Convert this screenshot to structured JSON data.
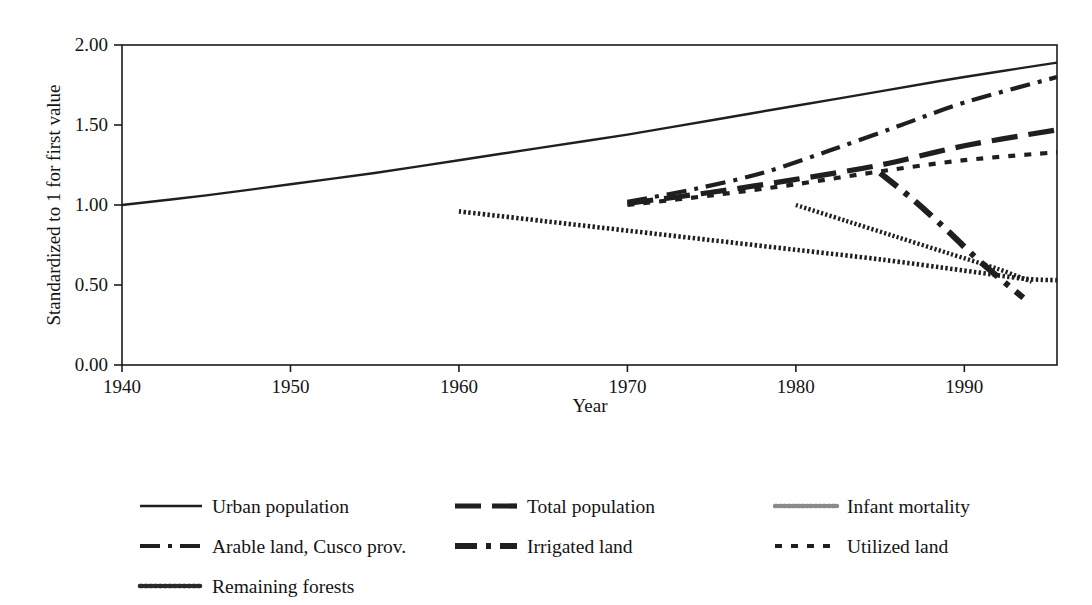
{
  "chart_data": {
    "type": "line",
    "title": "",
    "xlabel": "Year",
    "ylabel": "Standardized to 1 for first value",
    "xlim": [
      1940,
      1995.5
    ],
    "ylim": [
      0.0,
      2.0
    ],
    "xticks": [
      1940,
      1950,
      1960,
      1970,
      1980,
      1990
    ],
    "xtick_labels": [
      "1940",
      "1950",
      "1960",
      "1970",
      "1980",
      "1990"
    ],
    "yticks": [
      0.0,
      0.5,
      1.0,
      1.5,
      2.0
    ],
    "ytick_labels": [
      "0.00",
      "0.50",
      "1.00",
      "1.50",
      "2.00"
    ],
    "grid": false,
    "legend_position": "below-plot",
    "series": [
      {
        "name": "Urban population",
        "style": "solid",
        "x": [
          1940,
          1945,
          1950,
          1955,
          1960,
          1965,
          1970,
          1975,
          1980,
          1985,
          1990,
          1995.5
        ],
        "values": [
          1.0,
          1.06,
          1.13,
          1.2,
          1.28,
          1.36,
          1.44,
          1.53,
          1.62,
          1.71,
          1.8,
          1.89
        ]
      },
      {
        "name": "Total population",
        "style": "long-dash",
        "x": [
          1970,
          1975,
          1980,
          1985,
          1990,
          1995.5
        ],
        "values": [
          1.01,
          1.08,
          1.16,
          1.25,
          1.37,
          1.47
        ]
      },
      {
        "name": "Arable land, Cusco prov.",
        "style": "dash-dot",
        "x": [
          1970,
          1974,
          1978,
          1982,
          1986,
          1990,
          1995.5
        ],
        "values": [
          1.02,
          1.1,
          1.2,
          1.34,
          1.49,
          1.64,
          1.8
        ]
      },
      {
        "name": "Irrigated land",
        "style": "thick-dash-dot",
        "x": [
          1985,
          1987,
          1989,
          1991,
          1993.5
        ],
        "values": [
          1.2,
          1.03,
          0.84,
          0.64,
          0.42
        ]
      },
      {
        "name": "Utilized land",
        "style": "dotted",
        "x": [
          1970,
          1975,
          1980,
          1985,
          1990,
          1995.5
        ],
        "values": [
          1.0,
          1.06,
          1.13,
          1.21,
          1.28,
          1.33
        ]
      },
      {
        "name": "Infant mortality",
        "style": "beaded-light",
        "x": [
          1980,
          1983,
          1986,
          1989,
          1992,
          1994
        ],
        "values": [
          1.0,
          0.9,
          0.8,
          0.7,
          0.6,
          0.52
        ]
      },
      {
        "name": "Remaining forests",
        "style": "beaded-heavy",
        "x": [
          1960,
          1965,
          1970,
          1975,
          1980,
          1985,
          1990,
          1993.5,
          1995.5
        ],
        "values": [
          0.96,
          0.9,
          0.84,
          0.78,
          0.72,
          0.66,
          0.59,
          0.54,
          0.53
        ]
      }
    ]
  },
  "axes": {
    "x_title": "Year",
    "y_title": "Standardized to 1 for first value"
  },
  "legend": {
    "entries": [
      {
        "label": "Urban population",
        "style": "solid",
        "col": 0,
        "row": 0
      },
      {
        "label": "Total population",
        "style": "long-dash",
        "col": 1,
        "row": 0
      },
      {
        "label": "Infant mortality",
        "style": "beaded-light",
        "col": 2,
        "row": 0
      },
      {
        "label": "Arable land, Cusco prov.",
        "style": "dash-dot",
        "col": 0,
        "row": 1
      },
      {
        "label": "Irrigated land",
        "style": "thick-dash-dot",
        "col": 1,
        "row": 1
      },
      {
        "label": "Utilized land",
        "style": "dotted",
        "col": 2,
        "row": 1
      },
      {
        "label": "Remaining forests",
        "style": "beaded-heavy",
        "col": 0,
        "row": 2
      }
    ]
  },
  "colors": {
    "ink": "#1f1f1f",
    "frame": "#1c1c1c",
    "background": "#ffffff",
    "light_ink": "#6e6e6e"
  }
}
